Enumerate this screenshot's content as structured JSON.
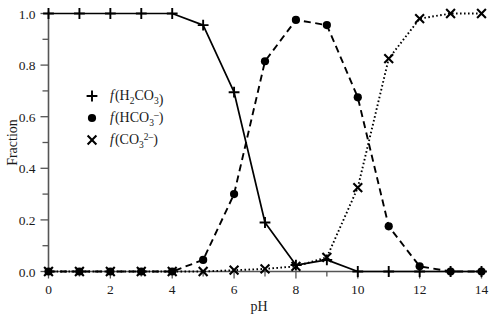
{
  "chart_data": {
    "type": "line",
    "title": "",
    "xlabel": "pH",
    "ylabel": "Fraction",
    "xlim": [
      0,
      14
    ],
    "ylim": [
      0.0,
      1.0
    ],
    "xticks": [
      0,
      1,
      2,
      3,
      4,
      5,
      6,
      7,
      8,
      9,
      10,
      11,
      12,
      13,
      14
    ],
    "xtick_labels": [
      "0",
      "",
      "2",
      "",
      "4",
      "",
      "6",
      "",
      "8",
      "",
      "10",
      "",
      "12",
      "",
      "14"
    ],
    "yticks": [
      0.0,
      0.1,
      0.2,
      0.3,
      0.4,
      0.5,
      0.6,
      0.7,
      0.8,
      0.9,
      1.0
    ],
    "ytick_labels": [
      "0.0",
      "",
      "0.2",
      "",
      "0.4",
      "",
      "0.6",
      "",
      "0.8",
      "",
      "1.0"
    ],
    "grid": false,
    "legend_position": "upper-left-inset",
    "x": [
      0,
      1,
      2,
      3,
      4,
      5,
      6,
      7,
      8,
      9,
      10,
      11,
      12,
      13,
      14
    ],
    "series": [
      {
        "name": "f(H2CO3)",
        "marker": "plus",
        "linestyle": "solid",
        "color": "#000000",
        "values": [
          1.0,
          1.0,
          1.0,
          1.0,
          1.0,
          0.955,
          0.695,
          0.19,
          0.025,
          0.045,
          0.0,
          0.0,
          0.0,
          0.0,
          0.0
        ]
      },
      {
        "name": "f(HCO3-)",
        "marker": "circle",
        "linestyle": "dashed",
        "color": "#000000",
        "values": [
          0.0,
          0.0,
          0.0,
          0.0,
          0.0,
          0.045,
          0.3,
          0.815,
          0.975,
          0.955,
          0.675,
          0.175,
          0.02,
          0.0,
          0.0
        ]
      },
      {
        "name": "f(CO3 2-)",
        "marker": "cross",
        "linestyle": "dotted",
        "color": "#000000",
        "values": [
          0.0,
          0.0,
          0.0,
          0.0,
          0.0,
          0.0,
          0.005,
          0.01,
          0.02,
          0.055,
          0.325,
          0.825,
          0.98,
          1.0,
          1.0
        ]
      }
    ]
  },
  "axes": {
    "y_title": "Fraction",
    "x_title": "pH"
  },
  "legend": [
    {
      "marker_glyph": "+",
      "marker_name": "plus-marker",
      "f": "f",
      "open_paren": "(",
      "species_pre": "H",
      "species_sub1": "2",
      "species_mid": "CO",
      "species_sub2": "3",
      "species_sup": "",
      "close_paren": ")"
    },
    {
      "marker_glyph": "●",
      "marker_name": "circle-marker",
      "f": "f",
      "open_paren": "(",
      "species_pre": "HCO",
      "species_sub1": "",
      "species_mid": "",
      "species_sub2": "3",
      "species_sup": "–",
      "close_paren": ")"
    },
    {
      "marker_glyph": "✕",
      "marker_name": "cross-marker",
      "f": "f",
      "open_paren": "(",
      "species_pre": "CO",
      "species_sub1": "",
      "species_mid": "",
      "species_sub2": "3",
      "species_sup": "2–",
      "close_paren": ")"
    }
  ]
}
